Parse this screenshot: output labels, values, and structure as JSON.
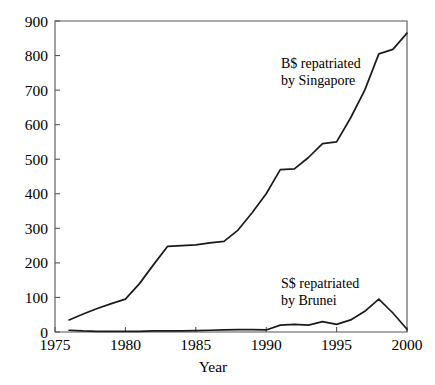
{
  "chart_data": {
    "type": "line",
    "title": "",
    "xlabel": "Year",
    "ylabel": "",
    "xlim": [
      1975,
      2000
    ],
    "ylim": [
      0,
      900
    ],
    "grid": false,
    "legend_position": "inline-annotations",
    "xticks": [
      1975,
      1980,
      1985,
      1990,
      1995,
      2000
    ],
    "xtick_labels": [
      "1975",
      "1980",
      "1985",
      "1990",
      "1995",
      "2000"
    ],
    "yticks": [
      0,
      100,
      200,
      300,
      400,
      500,
      600,
      700,
      800,
      900
    ],
    "ytick_labels": [
      "0",
      "100",
      "200",
      "300",
      "400",
      "500",
      "600",
      "700",
      "800",
      "900"
    ],
    "series": [
      {
        "name": "B$ repatriated by Singapore",
        "annotation_lines": [
          "B$ repatriated",
          "by Singapore"
        ],
        "x": [
          1976,
          1977,
          1978,
          1979,
          1980,
          1981,
          1982,
          1983,
          1984,
          1985,
          1986,
          1987,
          1988,
          1989,
          1990,
          1991,
          1992,
          1993,
          1994,
          1995,
          1996,
          1997,
          1998,
          1999,
          2000
        ],
        "values": [
          35,
          52,
          68,
          82,
          95,
          140,
          195,
          248,
          250,
          252,
          258,
          262,
          295,
          345,
          400,
          470,
          472,
          505,
          545,
          550,
          620,
          700,
          805,
          818,
          865
        ]
      },
      {
        "name": "S$ repatriated by Brunei",
        "annotation_lines": [
          "S$ repatriated",
          "by Brunei"
        ],
        "x": [
          1976,
          1977,
          1978,
          1979,
          1980,
          1981,
          1982,
          1983,
          1984,
          1985,
          1986,
          1987,
          1988,
          1989,
          1990,
          1991,
          1992,
          1993,
          1994,
          1995,
          1996,
          1997,
          1998,
          1999,
          2000
        ],
        "values": [
          5,
          3,
          2,
          2,
          2,
          2,
          3,
          3,
          3,
          4,
          5,
          6,
          7,
          7,
          6,
          20,
          22,
          20,
          30,
          22,
          35,
          60,
          95,
          55,
          8
        ]
      }
    ],
    "annotations": [
      {
        "id": "singapore-label",
        "lines": [
          "B$ repatriated",
          "by Singapore"
        ],
        "x_px": 281,
        "y_px": 68
      },
      {
        "id": "brunei-label",
        "lines": [
          "S$ repatriated",
          "by Brunei"
        ],
        "x_px": 281,
        "y_px": 288
      }
    ],
    "colors": {
      "line": "#1a1a1a",
      "axis": "#555555",
      "background": "#ffffff",
      "text": "#000000"
    }
  }
}
